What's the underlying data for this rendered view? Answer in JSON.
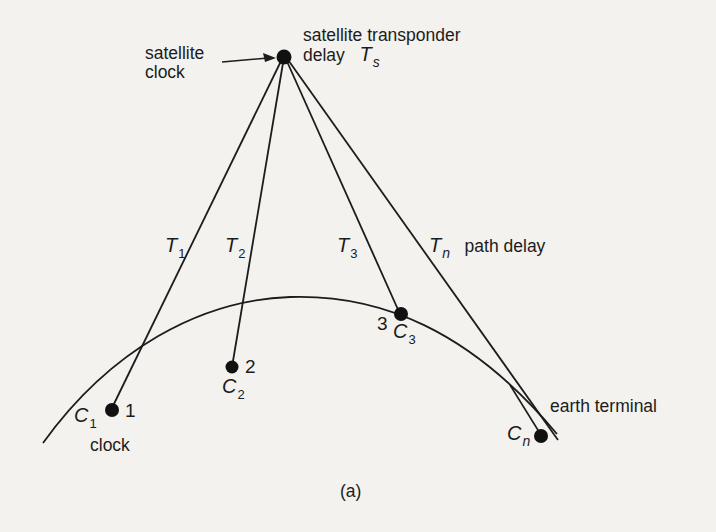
{
  "figure": {
    "caption": "(a)",
    "colors": {
      "background": "#f3f2ee",
      "ink": "#1c1c1c"
    }
  },
  "satellite": {
    "clock_label_line1": "satellite",
    "clock_label_line2": "clock",
    "transponder_label_line1": "satellite transponder",
    "transponder_label_line2": "delay",
    "delay_symbol": "T",
    "delay_subscript": "s"
  },
  "paths": [
    {
      "symbol": "T",
      "subscript": "1"
    },
    {
      "symbol": "T",
      "subscript": "2"
    },
    {
      "symbol": "T",
      "subscript": "3"
    },
    {
      "symbol": "T",
      "subscript": "n",
      "suffix": "path delay"
    }
  ],
  "terminals": [
    {
      "symbol": "C",
      "subscript": "1",
      "number": "1",
      "extra": "clock"
    },
    {
      "symbol": "C",
      "subscript": "2",
      "number": "2"
    },
    {
      "symbol": "C",
      "subscript": "3",
      "number": "3"
    },
    {
      "symbol": "C",
      "subscript": "n",
      "extra": "earth terminal"
    }
  ]
}
